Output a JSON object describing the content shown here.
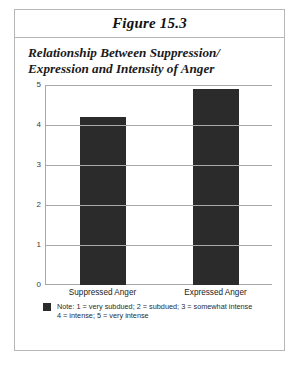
{
  "figure": {
    "label": "Figure 15.3",
    "subtitle_line1": "Relationship Between Suppression/",
    "subtitle_line2": "Expression and Intensity of Anger"
  },
  "legend": {
    "swatch_color": "#2b2b2b",
    "line1": "Note: 1 = very subdued; 2 = subdued; 3 = somewhat intense",
    "line2": "4 = intense; 5 = very intense"
  },
  "chart_data": {
    "type": "bar",
    "categories": [
      "Suppressed Anger",
      "Expressed Anger"
    ],
    "values": [
      4.2,
      4.9
    ],
    "xlabel": "",
    "ylabel": "",
    "ylim": [
      0,
      5
    ],
    "yticks": [
      "0",
      "1",
      "2",
      "3",
      "4",
      "5"
    ],
    "grid": true,
    "legend_position": "below",
    "bar_color": "#2b2b2b",
    "note": "1 = very subdued; 2 = subdued; 3 = somewhat intense; 4 = intense; 5 = very intense"
  }
}
